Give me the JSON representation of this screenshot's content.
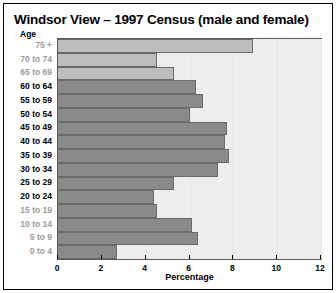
{
  "chart_data": {
    "type": "bar",
    "orientation": "horizontal",
    "title": "Windsor View – 1997 Census (male and female)",
    "xlabel": "Percentage",
    "ylabel": "Age",
    "xlim": [
      0,
      12
    ],
    "xticks": [
      0,
      2,
      4,
      6,
      8,
      10,
      12
    ],
    "xtick_labels": [
      "0",
      "2",
      "4",
      "6",
      "8",
      "10",
      "12"
    ],
    "grid": true,
    "legend": "none",
    "categories": [
      "75 +",
      "70 to 74",
      "65 to 69",
      "60 to 64",
      "55 to 59",
      "50 to 54",
      "45 to 49",
      "40 to 44",
      "35 to 39",
      "30 to 34",
      "25 to 29",
      "20 to 24",
      "15 to 19",
      "10 to 14",
      "5 to 9",
      "0 to 4"
    ],
    "values": [
      8.9,
      4.5,
      5.3,
      6.3,
      6.6,
      6.0,
      7.7,
      7.6,
      7.8,
      7.3,
      5.3,
      4.4,
      4.5,
      6.1,
      6.4,
      2.7
    ],
    "bar_colors": [
      "#bdbdbd",
      "#bdbdbd",
      "#bdbdbd",
      "#8a8a8a",
      "#8a8a8a",
      "#8a8a8a",
      "#8a8a8a",
      "#8a8a8a",
      "#8a8a8a",
      "#8a8a8a",
      "#8a8a8a",
      "#8a8a8a",
      "#8a8a8a",
      "#8a8a8a",
      "#8a8a8a",
      "#8a8a8a"
    ],
    "label_dim": [
      true,
      true,
      true,
      false,
      false,
      false,
      false,
      false,
      false,
      false,
      false,
      false,
      true,
      true,
      true,
      true
    ]
  },
  "style": {
    "plot_background": "#eeeeee",
    "grid_color": "#e2e2e2",
    "plot_border": "#5a5a5a",
    "bar_edge": "#6a6a6a",
    "text_color": "#000000",
    "dim_text_color": "#9a9a9a",
    "page_background": "#ffffff",
    "frame_color": "#000000"
  }
}
